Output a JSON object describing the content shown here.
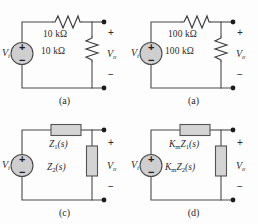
{
  "figure": {
    "background_color": "#fdfdfd",
    "line_color": "#4a4a4a",
    "element_fill": "#d0d0d0"
  },
  "circuits": [
    {
      "id": "circuit-a",
      "caption": "(a)",
      "source_label": "V",
      "source_subscript": "i",
      "source_plus": "+",
      "source_minus": "−",
      "series_element": {
        "kind": "resistor",
        "label": "10 kΩ"
      },
      "shunt_element": {
        "kind": "resistor",
        "label": "10 kΩ"
      },
      "output_label": "V",
      "output_subscript": "o",
      "output_plus": "+",
      "output_minus": "−"
    },
    {
      "id": "circuit-b",
      "caption": "(a)",
      "source_label": "V",
      "source_subscript": "i",
      "source_plus": "+",
      "source_minus": "−",
      "series_element": {
        "kind": "resistor",
        "label": "100 kΩ"
      },
      "shunt_element": {
        "kind": "resistor",
        "label": "100 kΩ"
      },
      "output_label": "V",
      "output_subscript": "o",
      "output_plus": "+",
      "output_minus": "−"
    },
    {
      "id": "circuit-c",
      "caption": "(c)",
      "source_label": "V",
      "source_subscript": "i",
      "source_plus": "+",
      "source_minus": "−",
      "series_element": {
        "kind": "impedance",
        "prefix": "",
        "symbol": "Z",
        "index": "1",
        "arg": "(s)"
      },
      "shunt_element": {
        "kind": "impedance",
        "prefix": "",
        "symbol": "Z",
        "index": "2",
        "arg": "(s)"
      },
      "output_label": "V",
      "output_subscript": "o",
      "output_plus": "+",
      "output_minus": "−"
    },
    {
      "id": "circuit-d",
      "caption": "(d)",
      "source_label": "V",
      "source_subscript": "i",
      "source_plus": "+",
      "source_minus": "−",
      "series_element": {
        "kind": "impedance",
        "prefix": "K",
        "prefix_sub": "m",
        "symbol": "Z",
        "index": "1",
        "arg": "(s)"
      },
      "shunt_element": {
        "kind": "impedance",
        "prefix": "K",
        "prefix_sub": "m",
        "symbol": "Z",
        "index": "2",
        "arg": "(s)"
      },
      "output_label": "V",
      "output_subscript": "o",
      "output_plus": "+",
      "output_minus": "−"
    }
  ]
}
